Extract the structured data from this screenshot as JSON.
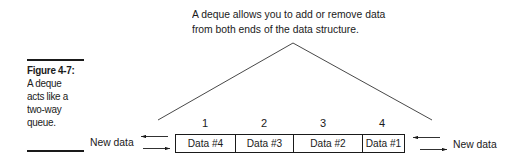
{
  "caption": {
    "figure_label": "Figure 4-7:",
    "lines": [
      "A deque",
      "acts like a",
      "two-way",
      "queue."
    ]
  },
  "annotation": {
    "lines": [
      "A deque allows you to add or remove data",
      "from both ends of the data structure."
    ]
  },
  "deque": {
    "indices": [
      "1",
      "2",
      "3",
      "4"
    ],
    "cells": [
      "Data #4",
      "Data #3",
      "Data #2",
      "Data #1"
    ]
  },
  "left_end": {
    "label": "New data",
    "arrows": [
      "out-left",
      "in-right"
    ]
  },
  "right_end": {
    "label": "New data",
    "arrows": [
      "in-left",
      "out-right"
    ]
  },
  "colors": {
    "ink": "#1a1a1a",
    "background": "#ffffff"
  }
}
